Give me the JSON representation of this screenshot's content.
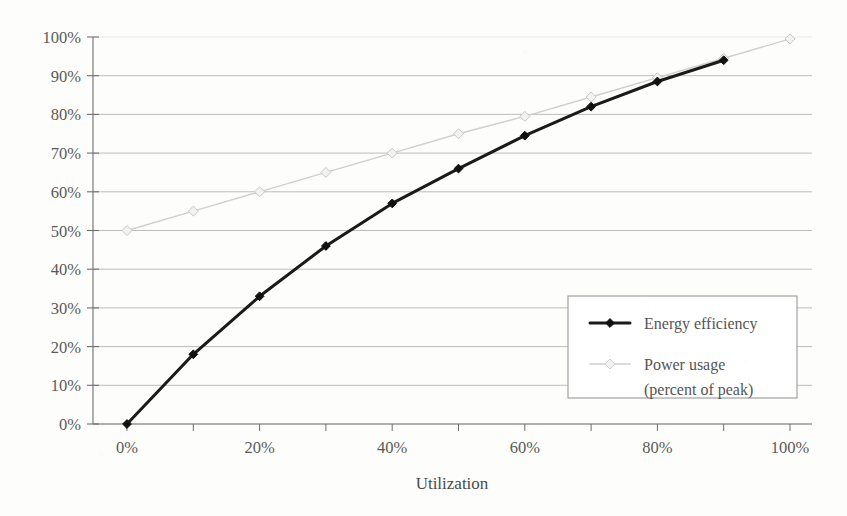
{
  "chart_data": {
    "type": "line",
    "title": "",
    "xlabel": "Utilization",
    "ylabel": "",
    "xlim": [
      0,
      100
    ],
    "ylim": [
      0,
      100
    ],
    "grid": true,
    "legend_position": "inside-right-lower",
    "x_tick_labels": [
      "0%",
      "20%",
      "40%",
      "60%",
      "80%",
      "100%"
    ],
    "x_tick_values": [
      0,
      20,
      40,
      60,
      80,
      100
    ],
    "x_minor_tick_values": [
      10,
      30,
      50,
      70,
      90
    ],
    "y_tick_labels": [
      "0%",
      "10%",
      "20%",
      "30%",
      "40%",
      "50%",
      "60%",
      "70%",
      "80%",
      "90%",
      "100%"
    ],
    "y_tick_values": [
      0,
      10,
      20,
      30,
      40,
      50,
      60,
      70,
      80,
      90,
      100
    ],
    "series": [
      {
        "name": "Energy efficiency",
        "color": "#1a1a1a",
        "marker": "diamond",
        "line_width": 3,
        "x": [
          0,
          10,
          20,
          30,
          40,
          50,
          60,
          70,
          80,
          90
        ],
        "values": [
          0,
          18,
          33,
          46,
          57,
          66,
          74.5,
          82,
          88.5,
          94
        ]
      },
      {
        "name": "Power usage\n(percent of peak)",
        "color": "#cfcfcf",
        "marker": "diamond",
        "line_width": 1.4,
        "x": [
          0,
          10,
          20,
          30,
          40,
          50,
          60,
          70,
          80,
          90,
          100
        ],
        "values": [
          50,
          55,
          60,
          65,
          70,
          75,
          79.5,
          84.5,
          89.5,
          94.5,
          99.5
        ]
      }
    ]
  },
  "axes": {
    "x_title": "Utilization",
    "y_tick_labels": [
      "100%",
      "90%",
      "80%",
      "70%",
      "60%",
      "50%",
      "40%",
      "30%",
      "20%",
      "10%",
      "0%"
    ],
    "x_tick_labels": [
      "0%",
      "20%",
      "40%",
      "60%",
      "80%",
      "100%"
    ]
  },
  "legend": {
    "items": [
      {
        "label": "Energy efficiency",
        "label_line2": "",
        "color": "#1a1a1a"
      },
      {
        "label": "Power usage",
        "label_line2": "(percent of peak)",
        "color": "#cfcfcf"
      }
    ]
  },
  "colors": {
    "energy_efficiency": "#1a1a1a",
    "power_usage": "#cfcfcf",
    "grid": "#9a9a98",
    "axis": "#6e6e6c",
    "text": "#55554f",
    "background": "#fdfdfc"
  }
}
